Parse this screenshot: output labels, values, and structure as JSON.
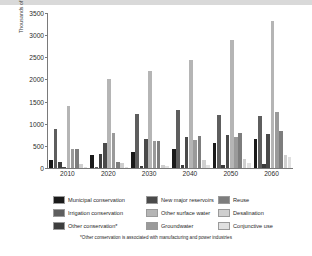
{
  "chart_data": {
    "type": "bar",
    "title": "",
    "xlabel": "",
    "ylabel": "Thousands of acre-feet",
    "ylim": [
      0,
      3500
    ],
    "yticks": [
      0,
      500,
      1000,
      1500,
      2000,
      2500,
      3000,
      3500
    ],
    "grid": false,
    "legend_position": "below",
    "categories": [
      "2010",
      "2020",
      "2030",
      "2040",
      "2050",
      "2060"
    ],
    "series": [
      {
        "name": "Municipal conservation",
        "color": "#1a1a1a",
        "values": [
          170,
          290,
          370,
          430,
          560,
          660
        ]
      },
      {
        "name": "Irrigation conservation",
        "color": "#5e5e5e",
        "values": [
          890,
          30,
          1230,
          1310,
          1200,
          1180
        ]
      },
      {
        "name": "Other conservation*",
        "color": "#3d3d3d",
        "values": [
          130,
          320,
          35,
          60,
          75,
          90
        ]
      },
      {
        "name": "New major reservoirs",
        "color": "#4a4a4a",
        "values": [
          20,
          560,
          660,
          700,
          740,
          760
        ]
      },
      {
        "name": "Other surface water",
        "color": "#b5b5b5",
        "values": [
          1410,
          2010,
          2180,
          2430,
          2900,
          3320
        ]
      },
      {
        "name": "Groundwater",
        "color": "#9a9a9a",
        "values": [
          430,
          790,
          620,
          640,
          690,
          1270
        ]
      },
      {
        "name": "Reuse",
        "color": "#7d7d7d",
        "values": [
          430,
          130,
          610,
          730,
          780,
          830
        ]
      },
      {
        "name": "Desalination",
        "color": "#cfcfcf",
        "values": [
          90,
          120,
          60,
          190,
          210,
          300
        ]
      },
      {
        "name": "Conjunctive use",
        "color": "#e0e0e0",
        "values": [
          30,
          25,
          40,
          60,
          120,
          260
        ]
      }
    ]
  },
  "legend": {
    "items": [
      {
        "label": "Municipal conservation",
        "color": "#1a1a1a"
      },
      {
        "label": "New major reservoirs",
        "color": "#4a4a4a"
      },
      {
        "label": "Reuse",
        "color": "#7d7d7d"
      },
      {
        "label": "Irrigation conservation",
        "color": "#5e5e5e"
      },
      {
        "label": "Other surface water",
        "color": "#b5b5b5"
      },
      {
        "label": "Desalination",
        "color": "#cfcfcf"
      },
      {
        "label": "Other conservation*",
        "color": "#3d3d3d"
      },
      {
        "label": "Groundwater",
        "color": "#9a9a9a"
      },
      {
        "label": "Conjunctive use",
        "color": "#e0e0e0"
      }
    ]
  },
  "footnote": "*Other conservation is associated with manufacturing and power industries"
}
